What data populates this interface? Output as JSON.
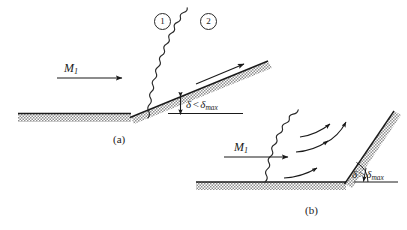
{
  "figure": {
    "background_color": "#ffffff",
    "line_color": "#1a1a1a",
    "hatch_color": "#8a8a8a",
    "width": 407,
    "height": 230
  },
  "regions": {
    "upstream_label": "1",
    "downstream_label": "2"
  },
  "panel_a": {
    "caption": "(a)",
    "mach_symbol": "M",
    "mach_subscript": "1",
    "angle_symbol": "δ",
    "angle_operator": "<",
    "angle_limit_symbol": "δ",
    "angle_limit_subscript": "max",
    "description": "attached oblique shock, deflection less than maximum"
  },
  "panel_b": {
    "caption": "(b)",
    "mach_symbol": "M",
    "mach_subscript": "1",
    "angle_symbol": "δ",
    "angle_operator": ">",
    "angle_limit_symbol": "δ",
    "angle_limit_subscript": "max",
    "description": "detached curved bow shock, deflection greater than maximum"
  }
}
